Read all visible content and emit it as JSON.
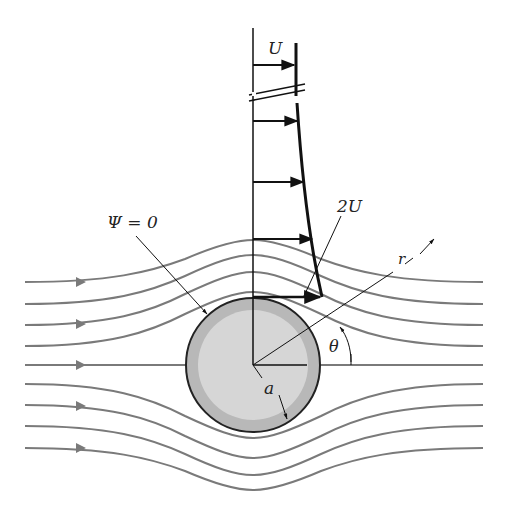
{
  "figure": {
    "labels": {
      "freestream": "U",
      "max_velocity": "2U",
      "stream_function": "Ψ = 0",
      "radius_coord": "r",
      "angle_coord": "θ",
      "cylinder_radius": "a"
    },
    "colors": {
      "streamline": "#7a7a7a",
      "profile": "#111111",
      "cylinder_outer": "#b8b8b8",
      "cylinder_inner": "#d6d6d6",
      "cylinder_edge": "#222222"
    },
    "streamline_count_above": 5,
    "streamline_count_below": 5,
    "velocity_profile_arrows": 5
  }
}
